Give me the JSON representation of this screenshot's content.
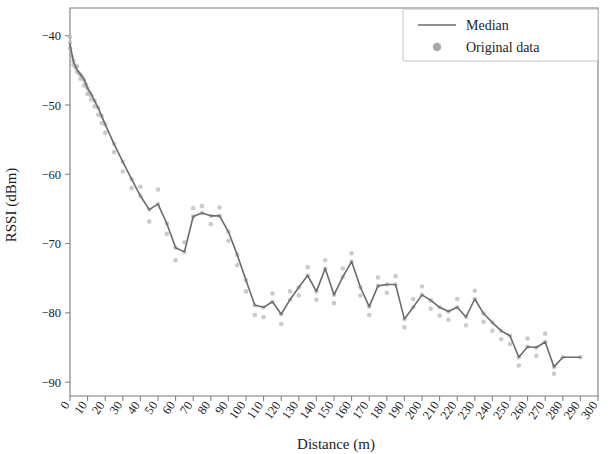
{
  "chart_data": {
    "type": "line",
    "title": "",
    "xlabel": "Distance (m)",
    "ylabel": "RSSI (dBm)",
    "xlim": [
      0,
      300
    ],
    "ylim": [
      -92,
      -36
    ],
    "grid": false,
    "legend_position": "top-right",
    "xticks": [
      0,
      10,
      20,
      30,
      40,
      50,
      60,
      70,
      80,
      90,
      100,
      110,
      120,
      130,
      140,
      150,
      160,
      170,
      180,
      190,
      200,
      210,
      220,
      230,
      240,
      250,
      260,
      270,
      280,
      290,
      300
    ],
    "yticks": [
      -40,
      -50,
      -60,
      -70,
      -80,
      -90
    ],
    "x": [
      0,
      2,
      4,
      6,
      8,
      10,
      12,
      14,
      16,
      18,
      20,
      25,
      30,
      35,
      40,
      45,
      50,
      55,
      60,
      65,
      70,
      75,
      80,
      85,
      90,
      95,
      100,
      105,
      110,
      115,
      120,
      125,
      130,
      135,
      140,
      145,
      150,
      155,
      160,
      165,
      170,
      175,
      180,
      185,
      190,
      195,
      200,
      205,
      210,
      215,
      220,
      225,
      230,
      235,
      240,
      245,
      250,
      255,
      260,
      265,
      270,
      275,
      280,
      285,
      290
    ],
    "series": [
      {
        "name": "Median",
        "marker": "line",
        "color": "#6b6b6b",
        "values": [
          -41.2,
          -43.8,
          -44.9,
          -45.6,
          -46.3,
          -47.6,
          -48.4,
          -49.4,
          -50.4,
          -51.6,
          -52.8,
          -55.6,
          -58.2,
          -60.7,
          -63.1,
          -65.1,
          -64.3,
          -67.1,
          -70.6,
          -71.2,
          -66.1,
          -65.6,
          -66.0,
          -66.0,
          -68.3,
          -71.6,
          -75.3,
          -78.9,
          -79.2,
          -78.4,
          -80.2,
          -78.1,
          -76.3,
          -74.6,
          -76.9,
          -73.6,
          -77.4,
          -74.8,
          -72.6,
          -76.3,
          -79.1,
          -76.1,
          -75.9,
          -75.9,
          -80.9,
          -79.2,
          -77.4,
          -78.2,
          -79.2,
          -79.8,
          -79.2,
          -80.6,
          -78.0,
          -80.1,
          -81.4,
          -82.6,
          -83.3,
          -86.4,
          -84.9,
          -85.0,
          -84.2,
          -87.8,
          -86.4,
          -86.4,
          -86.4
        ]
      },
      {
        "name": "Original data",
        "marker": "point",
        "color": "#b9b9b9",
        "note": "Scattered raw RSSI samples clustered around the median curve"
      }
    ],
    "scatter": [
      [
        0,
        -40.2
      ],
      [
        0,
        -41.0
      ],
      [
        0,
        -41.8
      ],
      [
        1,
        -43.0
      ],
      [
        2,
        -43.6
      ],
      [
        2,
        -44.2
      ],
      [
        3,
        -44.6
      ],
      [
        4,
        -44.4
      ],
      [
        4,
        -45.2
      ],
      [
        5,
        -45.4
      ],
      [
        6,
        -45.6
      ],
      [
        6,
        -46.2
      ],
      [
        7,
        -46.0
      ],
      [
        8,
        -46.4
      ],
      [
        8,
        -47.2
      ],
      [
        9,
        -47.0
      ],
      [
        10,
        -47.6
      ],
      [
        10,
        -48.4
      ],
      [
        11,
        -48.2
      ],
      [
        12,
        -48.6
      ],
      [
        12,
        -49.2
      ],
      [
        14,
        -49.4
      ],
      [
        14,
        -50.2
      ],
      [
        16,
        -50.4
      ],
      [
        16,
        -51.4
      ],
      [
        18,
        -51.6
      ],
      [
        18,
        -52.6
      ],
      [
        20,
        -52.8
      ],
      [
        20,
        -54.0
      ],
      [
        25,
        -55.6
      ],
      [
        25,
        -56.8
      ],
      [
        30,
        -58.2
      ],
      [
        30,
        -59.6
      ],
      [
        35,
        -60.7
      ],
      [
        35,
        -62.0
      ],
      [
        40,
        -63.1
      ],
      [
        40,
        -61.8
      ],
      [
        45,
        -65.1
      ],
      [
        45,
        -66.8
      ],
      [
        50,
        -64.3
      ],
      [
        50,
        -62.2
      ],
      [
        55,
        -67.1
      ],
      [
        55,
        -68.6
      ],
      [
        60,
        -70.6
      ],
      [
        60,
        -72.4
      ],
      [
        65,
        -71.2
      ],
      [
        65,
        -69.8
      ],
      [
        70,
        -66.1
      ],
      [
        70,
        -64.9
      ],
      [
        75,
        -65.6
      ],
      [
        75,
        -64.6
      ],
      [
        80,
        -66.0
      ],
      [
        80,
        -67.2
      ],
      [
        85,
        -66.0
      ],
      [
        85,
        -64.8
      ],
      [
        90,
        -68.3
      ],
      [
        90,
        -69.6
      ],
      [
        95,
        -71.6
      ],
      [
        95,
        -73.1
      ],
      [
        100,
        -75.3
      ],
      [
        100,
        -76.9
      ],
      [
        105,
        -78.9
      ],
      [
        105,
        -80.3
      ],
      [
        110,
        -79.2
      ],
      [
        110,
        -80.6
      ],
      [
        115,
        -78.4
      ],
      [
        115,
        -77.2
      ],
      [
        120,
        -80.2
      ],
      [
        120,
        -81.6
      ],
      [
        125,
        -78.1
      ],
      [
        125,
        -76.9
      ],
      [
        130,
        -76.3
      ],
      [
        130,
        -77.5
      ],
      [
        135,
        -74.6
      ],
      [
        135,
        -73.4
      ],
      [
        140,
        -76.9
      ],
      [
        140,
        -78.1
      ],
      [
        145,
        -73.6
      ],
      [
        145,
        -72.4
      ],
      [
        150,
        -77.4
      ],
      [
        150,
        -78.6
      ],
      [
        155,
        -74.8
      ],
      [
        155,
        -73.6
      ],
      [
        160,
        -72.6
      ],
      [
        160,
        -71.4
      ],
      [
        165,
        -76.3
      ],
      [
        165,
        -77.5
      ],
      [
        170,
        -79.1
      ],
      [
        170,
        -80.3
      ],
      [
        175,
        -76.1
      ],
      [
        175,
        -74.9
      ],
      [
        180,
        -75.9
      ],
      [
        180,
        -77.1
      ],
      [
        185,
        -75.9
      ],
      [
        185,
        -74.7
      ],
      [
        190,
        -80.9
      ],
      [
        190,
        -82.1
      ],
      [
        195,
        -79.2
      ],
      [
        195,
        -78.0
      ],
      [
        200,
        -77.4
      ],
      [
        200,
        -76.2
      ],
      [
        205,
        -78.2
      ],
      [
        205,
        -79.4
      ],
      [
        210,
        -79.2
      ],
      [
        210,
        -80.4
      ],
      [
        215,
        -79.8
      ],
      [
        215,
        -81.0
      ],
      [
        220,
        -79.2
      ],
      [
        220,
        -78.0
      ],
      [
        225,
        -80.6
      ],
      [
        225,
        -81.8
      ],
      [
        230,
        -78.0
      ],
      [
        230,
        -76.8
      ],
      [
        235,
        -80.1
      ],
      [
        235,
        -81.3
      ],
      [
        240,
        -81.4
      ],
      [
        240,
        -82.6
      ],
      [
        245,
        -82.6
      ],
      [
        245,
        -83.8
      ],
      [
        250,
        -83.3
      ],
      [
        250,
        -84.5
      ],
      [
        255,
        -86.4
      ],
      [
        255,
        -87.6
      ],
      [
        260,
        -84.9
      ],
      [
        260,
        -83.7
      ],
      [
        265,
        -85.0
      ],
      [
        265,
        -86.2
      ],
      [
        270,
        -84.2
      ],
      [
        270,
        -83.0
      ],
      [
        275,
        -87.8
      ],
      [
        275,
        -88.8
      ],
      [
        280,
        -86.4
      ],
      [
        290,
        -86.4
      ]
    ],
    "legend": [
      {
        "label": "Median",
        "type": "line",
        "color": "#6b6b6b"
      },
      {
        "label": "Original data",
        "type": "marker",
        "color": "#a9a9a9"
      }
    ]
  },
  "colors": {
    "median": "#6b6b6b",
    "scatter": "#b9b9b9",
    "axis": "#7b7b7b",
    "text": "#1c1c1c",
    "background": "#ffffff"
  }
}
